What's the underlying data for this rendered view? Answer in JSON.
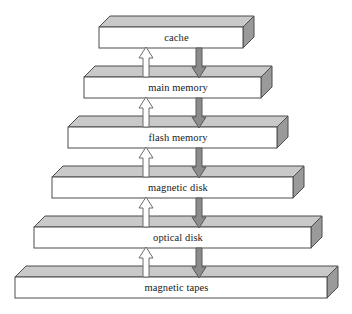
{
  "diagram": {
    "type": "storage-hierarchy-pyramid",
    "canvas": {
      "width": 352,
      "height": 314,
      "background": "#ffffff"
    },
    "colors": {
      "slab_front": "#ffffff",
      "slab_top": "#c9c9c9",
      "slab_side": "#9a9a9a",
      "outline": "#4d4d4d",
      "label_text": "#1a1a1a",
      "up_arrow_fill": "#ffffff",
      "up_arrow_stroke": "#6b6b6b",
      "down_arrow_fill": "#8c8c8c",
      "down_arrow_stroke": "#5a5a5a"
    },
    "levels": [
      {
        "label": "cache",
        "index": 0,
        "front_left": 99,
        "front_right": 243,
        "front_top": 27,
        "front_bottom": 48,
        "depth_x": 11,
        "depth_y": 11
      },
      {
        "label": "main memory",
        "index": 1,
        "front_left": 84,
        "front_right": 261,
        "front_top": 77,
        "front_bottom": 98,
        "depth_x": 11,
        "depth_y": 11
      },
      {
        "label": "flash memory",
        "index": 2,
        "front_left": 68,
        "front_right": 277,
        "front_top": 127,
        "front_bottom": 148,
        "depth_x": 11,
        "depth_y": 11
      },
      {
        "label": "magnetic disk",
        "index": 3,
        "front_left": 52,
        "front_right": 293,
        "front_top": 177,
        "front_bottom": 198,
        "depth_x": 11,
        "depth_y": 11
      },
      {
        "label": "optical disk",
        "index": 4,
        "front_left": 34,
        "front_right": 311,
        "front_top": 227,
        "front_bottom": 248,
        "depth_x": 11,
        "depth_y": 11
      },
      {
        "label": "magnetic tapes",
        "index": 5,
        "front_left": 15,
        "front_right": 327,
        "front_top": 277,
        "front_bottom": 298,
        "depth_x": 11,
        "depth_y": 11
      }
    ],
    "up_arrows": {
      "direction": "up",
      "semantic": "data-moves-toward-faster-storage",
      "x_center": 146,
      "shaft_width": 6,
      "head_width": 14,
      "head_height": 11,
      "segments": [
        {
          "from_level": 1,
          "to_level": 0,
          "y_bottom": 77,
          "y_top": 47
        },
        {
          "from_level": 2,
          "to_level": 1,
          "y_bottom": 127,
          "y_top": 97
        },
        {
          "from_level": 3,
          "to_level": 2,
          "y_bottom": 177,
          "y_top": 147
        },
        {
          "from_level": 4,
          "to_level": 3,
          "y_bottom": 227,
          "y_top": 197
        },
        {
          "from_level": 5,
          "to_level": 4,
          "y_bottom": 277,
          "y_top": 247
        }
      ]
    },
    "down_arrows": {
      "direction": "down",
      "semantic": "data-moves-toward-larger-slower-storage",
      "x_center": 199,
      "shaft_width": 6,
      "head_width": 14,
      "head_height": 11,
      "segments": [
        {
          "from_level": 0,
          "to_level": 1,
          "y_top": 48,
          "y_bottom": 78
        },
        {
          "from_level": 1,
          "to_level": 2,
          "y_top": 98,
          "y_bottom": 128
        },
        {
          "from_level": 2,
          "to_level": 3,
          "y_top": 148,
          "y_bottom": 178
        },
        {
          "from_level": 3,
          "to_level": 4,
          "y_top": 198,
          "y_bottom": 228
        },
        {
          "from_level": 4,
          "to_level": 5,
          "y_top": 248,
          "y_bottom": 278
        }
      ]
    }
  }
}
